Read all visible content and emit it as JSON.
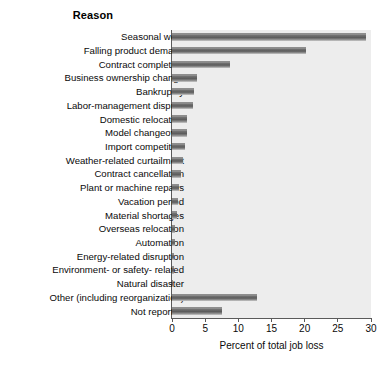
{
  "chart_data": {
    "type": "bar",
    "orientation": "horizontal",
    "title": "Reason",
    "xlabel": "Percent of total job loss",
    "ylabel": "",
    "xlim": [
      0,
      30
    ],
    "xticks": [
      0,
      5,
      10,
      15,
      20,
      25,
      30
    ],
    "xtick_labels": [
      "0",
      "5",
      "10",
      "15",
      "20",
      "25",
      "30"
    ],
    "grid": false,
    "legend": "none",
    "panel_background": "#ededed",
    "bar_color": "#5c5c5c",
    "categories": [
      "Seasonal work",
      "Falling product demand",
      "Contract completion",
      "Business ownership change",
      "Bankruptcy",
      "Labor-management dispute",
      "Domestic relocation",
      "Model changeover",
      "Import competition",
      "Weather-related curtailment",
      "Contract cancellation",
      "Plant or machine repairs",
      "Vacation period",
      "Material shortages",
      "Overseas relocation",
      "Automation",
      "Energy-related disruption",
      "Environment- or safety- related",
      "Natural disaster",
      "Other (including reorganization)",
      "Not reported"
    ],
    "values": [
      29.3,
      20.2,
      8.7,
      3.8,
      3.3,
      3.2,
      2.3,
      2.2,
      1.9,
      1.7,
      1.3,
      1.1,
      0.9,
      0.7,
      0.5,
      0.4,
      0.3,
      0.3,
      0.2,
      12.8,
      7.6
    ]
  }
}
